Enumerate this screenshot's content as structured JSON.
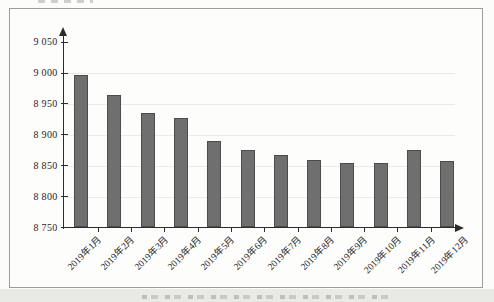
{
  "page": {
    "background": "#fcfcfa",
    "bottom_band_color": "#e9e9e6"
  },
  "frame": {
    "border_color": "#9d9d9b",
    "fill": "#fdfdfc"
  },
  "chart_data": {
    "type": "bar",
    "title": "",
    "xlabel": "",
    "ylabel": "",
    "legend_position": "none",
    "grid": "faint-horizontal",
    "categories": [
      "2019年1月",
      "2019年2月",
      "2019年3月",
      "2019年4月",
      "2019年5月",
      "2019年6月",
      "2019年7月",
      "2019年8月",
      "2019年9月",
      "2019年10月",
      "2019年11月",
      "2019年12月"
    ],
    "values": [
      8997,
      8965,
      8935,
      8927,
      8890,
      8876,
      8868,
      8859,
      8855,
      8855,
      8876,
      8857
    ],
    "ylim": [
      8750,
      9050
    ],
    "ytick_step": 50,
    "ytick_labels_top_to_bottom": [
      "9 050",
      "9 000",
      "8 950",
      "8 900",
      "8 850",
      "8 800",
      "8 750"
    ],
    "bar_color": "#6f6f6f",
    "bar_border_color": "#4c4c4c",
    "axis_color": "#2c2c2c",
    "label_color": "#1f1f1f",
    "grid_color": "rgba(110,110,105,0.12)"
  }
}
